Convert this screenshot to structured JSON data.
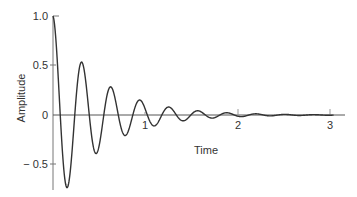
{
  "chart_data": {
    "type": "line",
    "title": "",
    "xlabel": "Time",
    "ylabel": "Amplitude",
    "xlim": [
      0,
      3.15
    ],
    "ylim": [
      -0.75,
      1.0
    ],
    "x_ticks": [
      "1",
      "2",
      "3"
    ],
    "y_ticks": [
      "1.0",
      "0.5",
      "0",
      "-0.5"
    ],
    "grid": false,
    "legend": null,
    "series": [
      {
        "name": "damped oscillation",
        "description": "Exponentially decaying cosine, approx y = exp(-2t) * cos(2*pi*3.17*t)",
        "x": [
          0,
          0.079,
          0.158,
          0.237,
          0.315,
          0.394,
          0.473,
          0.552,
          0.631,
          0.71,
          0.789,
          0.868,
          0.946,
          1.025,
          1.104,
          1.262,
          1.42,
          1.577,
          1.735,
          1.893,
          2.05,
          2.366,
          2.681,
          3.0
        ],
        "values": [
          1.0,
          0.0,
          -0.73,
          0.0,
          0.53,
          0.0,
          -0.39,
          0.0,
          0.28,
          0.0,
          -0.21,
          0.0,
          0.15,
          0.0,
          -0.11,
          0.08,
          0.06,
          0.04,
          0.03,
          0.02,
          0.017,
          0.009,
          0.005,
          0.0
        ]
      }
    ],
    "color": "#333333"
  },
  "axes": {
    "x_label": "Time",
    "y_label": "Amplitude",
    "x_tick_labels": [
      "1",
      "2",
      "3"
    ],
    "y_tick_labels": [
      "1.0",
      "0.5",
      "0",
      "− 0.5"
    ]
  }
}
